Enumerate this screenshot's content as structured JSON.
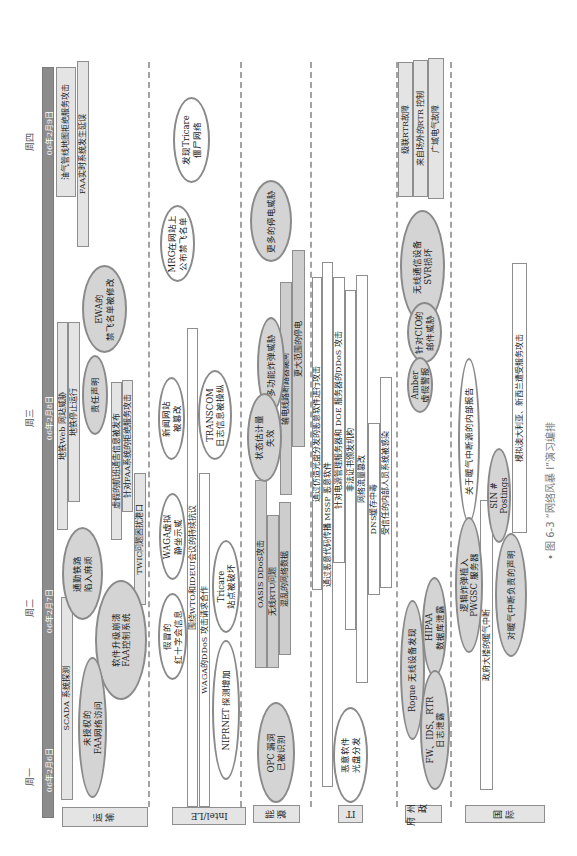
{
  "header": {
    "days": [
      {
        "weekday": "周一",
        "date": "06年2月6日"
      },
      {
        "weekday": "周二",
        "date": "06年2月7日"
      },
      {
        "weekday": "周三",
        "date": "06年2月8日"
      },
      {
        "weekday": "周四",
        "date": "06年2月9日"
      }
    ]
  },
  "lanes": {
    "transport": {
      "label": "运输",
      "bars": [
        "油气管线地图拒绝服务攻击",
        "FAA实时系统发生延误",
        "地铁Web 网站威胁",
        "地铁停止运行",
        "虚假的航班通告信息被发布",
        "针对FAA系统的拒绝服务攻击",
        "TWIC问题困扰港口",
        "SCADA 系统探测"
      ],
      "events": [
        "EWA的\n禁飞名单被修改",
        "责任声明",
        "通勤铁路\n陷入麻烦",
        "软件升级崩溃\nFAA控制系统",
        "未授权的\nFAA网络访问"
      ]
    },
    "intel": {
      "label": "Intel/LE",
      "bars": [
        "围绕WTO和IDEUI会议的持续抗议",
        "WAGA的DDoS 攻击请求合作"
      ],
      "events": [
        "发现Tricare\n僵尸网络",
        "MRG在网站上\n公布禁飞名单",
        "新闻网站\n被篡改",
        "TRANSCOM\n日志信息被操纵",
        "WAGA虚拟\n静坐示威",
        "假冒的\n红十字会信息",
        "Tricare\n站点被破坏",
        "NIPRNET 探测增加"
      ]
    },
    "energy": {
      "label": "能源",
      "bars": [
        "输电线路断路器跳闸",
        "更大范围的停电",
        "OASIS DDoS攻击",
        "无线RTU问题",
        "混乱的网络数据"
      ],
      "events": [
        "更多的停电威胁",
        "多功能炸弹威胁",
        "状态估计量\n失效",
        "OPC 漏洞\n已被识别"
      ]
    },
    "it": {
      "label": "IT",
      "bars": [
        "通过仿造光盘分发的恶意软件进行攻击",
        "通过恶意代码传播 MSSP 恶意软件",
        "针对电源管理服务器和 DOE 服务器的DDoS 攻击",
        "非法证书颁发机构",
        "网络流量篡改",
        "DNS缓存中毒",
        "受信任的内部人员系统被感染"
      ],
      "events": [
        "恶意软件\n光盘分发"
      ]
    },
    "state": {
      "label": "州政府",
      "bars": [
        "级联RTR故障",
        "来自场外的RTR 控制",
        "广域电气故障"
      ],
      "events": [
        "无线通信设备\nSVR损坏",
        "针对CIO的\n邮件威胁",
        "Amber\n虚假警报",
        "HIPAA\n数据库泄露",
        "Rogue  无线设备发现",
        "FW、IDS、RTR\n日志泄露"
      ]
    },
    "international": {
      "label": "国际",
      "bars": [
        "政府大楼的暖气中断",
        "模拟澳大利亚、新西兰遭受服务攻击"
      ],
      "events": [
        "关于暖气中断源的内部报告",
        "逻辑炸弹植入\nPWGSC 服务器",
        "SIN #\nPostings",
        "对暖气中断负责的声明"
      ]
    }
  },
  "caption": "• 图 6-3 “网络风暴 I”演习编排"
}
